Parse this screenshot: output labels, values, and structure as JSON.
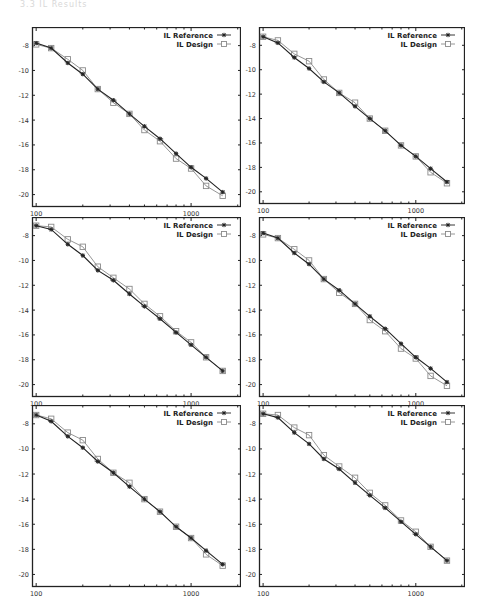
{
  "header_fragment": "3.3    IL Results",
  "chart_data": [
    {
      "type": "line",
      "panel": "top-left",
      "x": [
        100,
        125,
        160,
        200,
        250,
        315,
        400,
        500,
        630,
        800,
        1000,
        1250,
        1600
      ],
      "xscale": "log",
      "xlim": [
        94,
        2100
      ],
      "ylim": [
        -21,
        -6.5
      ],
      "xticks": [
        100,
        1000
      ],
      "xtick_labels": [
        "100",
        "1000"
      ],
      "yticks": [
        -8,
        -10,
        -12,
        -14,
        -16,
        -18,
        -20
      ],
      "ytick_labels": [
        "-8",
        "-10",
        "-12",
        "-14",
        "-16",
        "-18",
        "-20"
      ],
      "grid": false,
      "legend_position": "top-right",
      "series": [
        {
          "name": "IL Reference",
          "marker": "asterisk",
          "values": [
            -7.8,
            -8.2,
            -9.4,
            -10.3,
            -11.5,
            -12.4,
            -13.5,
            -14.5,
            -15.5,
            -16.7,
            -17.8,
            -18.7,
            -19.8
          ]
        },
        {
          "name": "IL Design",
          "marker": "square",
          "values": [
            -7.9,
            -8.2,
            -9.1,
            -10.0,
            -11.5,
            -12.6,
            -13.5,
            -14.8,
            -15.7,
            -17.1,
            -17.9,
            -19.3,
            -20.1
          ]
        }
      ]
    },
    {
      "type": "line",
      "panel": "top-right",
      "x": [
        100,
        125,
        160,
        200,
        250,
        315,
        400,
        500,
        630,
        800,
        1000,
        1250,
        1600
      ],
      "xscale": "log",
      "xlim": [
        94,
        2100
      ],
      "ylim": [
        -21,
        -6.5
      ],
      "xticks": [
        100,
        1000
      ],
      "xtick_labels": [
        "100",
        "1000"
      ],
      "yticks": [
        -8,
        -10,
        -12,
        -14,
        -16,
        -18,
        -20
      ],
      "ytick_labels": [
        "-8",
        "-10",
        "-12",
        "-14",
        "-16",
        "-18",
        "-20"
      ],
      "grid": false,
      "legend_position": "top-right",
      "series": [
        {
          "name": "IL Reference",
          "marker": "asterisk",
          "values": [
            -7.3,
            -7.8,
            -9.0,
            -9.9,
            -11.0,
            -11.9,
            -13.0,
            -14.0,
            -15.0,
            -16.2,
            -17.1,
            -18.1,
            -19.2
          ]
        },
        {
          "name": "IL Design",
          "marker": "square",
          "values": [
            -7.3,
            -7.6,
            -8.7,
            -9.3,
            -10.8,
            -11.9,
            -12.7,
            -14.0,
            -15.0,
            -16.2,
            -17.1,
            -18.4,
            -19.3
          ]
        }
      ]
    },
    {
      "type": "line",
      "panel": "middle-left",
      "x": [
        100,
        125,
        160,
        200,
        250,
        315,
        400,
        500,
        630,
        800,
        1000,
        1250,
        1600
      ],
      "xscale": "log",
      "xlim": [
        94,
        2100
      ],
      "ylim": [
        -21,
        -6.5
      ],
      "xticks": [
        100,
        1000
      ],
      "xtick_labels": [
        "100",
        "1000"
      ],
      "yticks": [
        -8,
        -10,
        -12,
        -14,
        -16,
        -18,
        -20
      ],
      "ytick_labels": [
        "-8",
        "-10",
        "-12",
        "-14",
        "-16",
        "-18",
        "-20"
      ],
      "grid": false,
      "legend_position": "top-right",
      "series": [
        {
          "name": "IL Reference",
          "marker": "asterisk",
          "values": [
            -7.2,
            -7.5,
            -8.7,
            -9.6,
            -10.8,
            -11.6,
            -12.7,
            -13.7,
            -14.7,
            -15.8,
            -16.8,
            -17.8,
            -18.9
          ]
        },
        {
          "name": "IL Design",
          "marker": "square",
          "values": [
            -7.2,
            -7.3,
            -8.3,
            -8.9,
            -10.5,
            -11.4,
            -12.3,
            -13.5,
            -14.5,
            -15.7,
            -16.6,
            -17.8,
            -18.9
          ]
        }
      ]
    },
    {
      "type": "line",
      "panel": "middle-right",
      "x": [
        100,
        125,
        160,
        200,
        250,
        315,
        400,
        500,
        630,
        800,
        1000,
        1250,
        1600
      ],
      "xscale": "log",
      "xlim": [
        94,
        2100
      ],
      "ylim": [
        -21,
        -6.5
      ],
      "xticks": [
        100,
        1000
      ],
      "xtick_labels": [
        "100",
        "1000"
      ],
      "yticks": [
        -8,
        -10,
        -12,
        -14,
        -16,
        -18,
        -20
      ],
      "ytick_labels": [
        "-8",
        "-10",
        "-12",
        "-14",
        "-16",
        "-18",
        "-20"
      ],
      "grid": false,
      "legend_position": "top-right",
      "series": [
        {
          "name": "IL Reference",
          "marker": "asterisk",
          "values": [
            -7.8,
            -8.2,
            -9.4,
            -10.3,
            -11.5,
            -12.4,
            -13.5,
            -14.5,
            -15.5,
            -16.7,
            -17.8,
            -18.7,
            -19.8
          ]
        },
        {
          "name": "IL Design",
          "marker": "square",
          "values": [
            -7.9,
            -8.2,
            -9.1,
            -10.0,
            -11.5,
            -12.6,
            -13.5,
            -14.8,
            -15.7,
            -17.1,
            -17.9,
            -19.3,
            -20.1
          ]
        }
      ]
    },
    {
      "type": "line",
      "panel": "bottom-left",
      "x": [
        100,
        125,
        160,
        200,
        250,
        315,
        400,
        500,
        630,
        800,
        1000,
        1250,
        1600
      ],
      "xscale": "log",
      "xlim": [
        94,
        2100
      ],
      "ylim": [
        -21,
        -6.5
      ],
      "xticks": [
        100,
        1000
      ],
      "xtick_labels": [
        "100",
        "1000"
      ],
      "yticks": [
        -8,
        -10,
        -12,
        -14,
        -16,
        -18,
        -20
      ],
      "ytick_labels": [
        "-8",
        "-10",
        "-12",
        "-14",
        "-16",
        "-18",
        "-20"
      ],
      "grid": false,
      "legend_position": "top-right",
      "series": [
        {
          "name": "IL Reference",
          "marker": "asterisk",
          "values": [
            -7.3,
            -7.8,
            -9.0,
            -9.9,
            -11.0,
            -11.9,
            -13.0,
            -14.0,
            -15.0,
            -16.2,
            -17.1,
            -18.1,
            -19.2
          ]
        },
        {
          "name": "IL Design",
          "marker": "square",
          "values": [
            -7.3,
            -7.6,
            -8.7,
            -9.3,
            -10.8,
            -11.9,
            -12.7,
            -14.0,
            -15.0,
            -16.2,
            -17.1,
            -18.4,
            -19.3
          ]
        }
      ]
    },
    {
      "type": "line",
      "panel": "bottom-right",
      "x": [
        100,
        125,
        160,
        200,
        250,
        315,
        400,
        500,
        630,
        800,
        1000,
        1250,
        1600
      ],
      "xscale": "log",
      "xlim": [
        94,
        2100
      ],
      "ylim": [
        -21,
        -6.5
      ],
      "xticks": [
        100,
        1000
      ],
      "xtick_labels": [
        "100",
        "1000"
      ],
      "yticks": [
        -8,
        -10,
        -12,
        -14,
        -16,
        -18,
        -20
      ],
      "ytick_labels": [
        "-8",
        "-10",
        "-12",
        "-14",
        "-16",
        "-18",
        "-20"
      ],
      "grid": false,
      "legend_position": "top-right",
      "series": [
        {
          "name": "IL Reference",
          "marker": "asterisk",
          "values": [
            -7.2,
            -7.5,
            -8.7,
            -9.6,
            -10.8,
            -11.6,
            -12.7,
            -13.7,
            -14.7,
            -15.8,
            -16.8,
            -17.8,
            -18.9
          ]
        },
        {
          "name": "IL Design",
          "marker": "square",
          "values": [
            -7.2,
            -7.3,
            -8.3,
            -8.9,
            -10.5,
            -11.4,
            -12.3,
            -13.5,
            -14.5,
            -15.7,
            -16.6,
            -17.8,
            -18.9
          ]
        }
      ]
    }
  ],
  "layout": {
    "panels": [
      {
        "left": 32,
        "top": 27,
        "width": 209,
        "height": 180
      },
      {
        "left": 259,
        "top": 27,
        "width": 206,
        "height": 177
      },
      {
        "left": 32,
        "top": 217,
        "width": 209,
        "height": 180
      },
      {
        "left": 259,
        "top": 217,
        "width": 206,
        "height": 180
      },
      {
        "left": 32,
        "top": 405,
        "width": 209,
        "height": 182
      },
      {
        "left": 259,
        "top": 405,
        "width": 206,
        "height": 182
      }
    ],
    "colors": {
      "reference": "#222222",
      "design": "#8a8a8a",
      "axis": "#222222",
      "tick_text": "#333333"
    }
  }
}
